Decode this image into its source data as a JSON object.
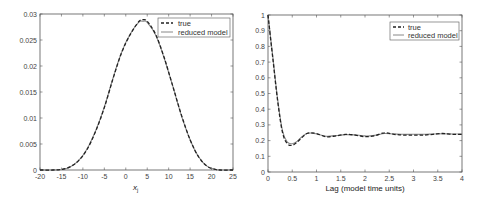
{
  "chart_data": [
    {
      "type": "line",
      "title": "",
      "xlabel": "x_j",
      "ylabel": "",
      "xlim": [
        -20,
        25
      ],
      "ylim": [
        0,
        0.03
      ],
      "xticks": [
        "-20",
        "-15",
        "-10",
        "-5",
        "0",
        "5",
        "10",
        "15",
        "20",
        "25"
      ],
      "yticks": [
        "0",
        "0.005",
        "0.01",
        "0.015",
        "0.02",
        "0.025",
        "0.03"
      ],
      "grid": false,
      "legend_position": "upper right",
      "legend": [
        "true",
        "reduced model"
      ],
      "series": [
        {
          "name": "true",
          "style": "dashed",
          "x": [
            -20,
            -17,
            -15,
            -13,
            -11,
            -9,
            -7,
            -5,
            -3,
            -1,
            1,
            3,
            4,
            5,
            7,
            9,
            11,
            13,
            15,
            17,
            19,
            21,
            22,
            25
          ],
          "y": [
            0,
            0,
            0.0001,
            0.0006,
            0.0018,
            0.004,
            0.0075,
            0.012,
            0.0175,
            0.0225,
            0.026,
            0.0285,
            0.0289,
            0.0286,
            0.026,
            0.0215,
            0.016,
            0.0105,
            0.0058,
            0.0025,
            0.0007,
            0.0001,
            0,
            0
          ]
        },
        {
          "name": "reduced model",
          "style": "solid",
          "x": [
            -20,
            -17,
            -15,
            -13,
            -11,
            -9,
            -7,
            -5,
            -3,
            -1,
            1,
            3,
            4,
            5,
            7,
            9,
            11,
            13,
            15,
            17,
            19,
            21,
            22,
            25
          ],
          "y": [
            0,
            0,
            0.0001,
            0.0006,
            0.0018,
            0.0041,
            0.0076,
            0.0121,
            0.0176,
            0.0226,
            0.0261,
            0.0284,
            0.0286,
            0.0284,
            0.0259,
            0.0214,
            0.016,
            0.0104,
            0.0058,
            0.0025,
            0.0007,
            0.0001,
            0,
            0
          ]
        }
      ]
    },
    {
      "type": "line",
      "title": "",
      "xlabel": "Lag (model time units)",
      "ylabel": "",
      "xlim": [
        0,
        4
      ],
      "ylim": [
        0,
        1
      ],
      "xticks": [
        "0",
        "0.5",
        "1",
        "1.5",
        "2",
        "2.5",
        "3",
        "3.5",
        "4"
      ],
      "yticks": [
        "0",
        "0.1",
        "0.2",
        "0.3",
        "0.4",
        "0.5",
        "0.6",
        "0.7",
        "0.8",
        "0.9",
        "1"
      ],
      "grid": false,
      "legend_position": "upper right",
      "legend": [
        "true",
        "reduced model"
      ],
      "series": [
        {
          "name": "true",
          "style": "dashed",
          "x": [
            0,
            0.1,
            0.2,
            0.3,
            0.4,
            0.5,
            0.6,
            0.7,
            0.8,
            0.9,
            1.0,
            1.2,
            1.4,
            1.6,
            1.8,
            2.0,
            2.2,
            2.4,
            2.6,
            2.8,
            3.0,
            3.2,
            3.4,
            3.6,
            3.8,
            4.0
          ],
          "y": [
            1.0,
            0.72,
            0.45,
            0.25,
            0.18,
            0.17,
            0.19,
            0.22,
            0.245,
            0.25,
            0.245,
            0.225,
            0.23,
            0.24,
            0.235,
            0.225,
            0.23,
            0.25,
            0.24,
            0.235,
            0.235,
            0.235,
            0.24,
            0.245,
            0.24,
            0.24
          ]
        },
        {
          "name": "reduced model",
          "style": "solid",
          "x": [
            0,
            0.1,
            0.2,
            0.3,
            0.4,
            0.5,
            0.6,
            0.7,
            0.8,
            0.9,
            1.0,
            1.2,
            1.4,
            1.6,
            1.8,
            2.0,
            2.2,
            2.4,
            2.6,
            2.8,
            3.0,
            3.2,
            3.4,
            3.6,
            3.8,
            4.0
          ],
          "y": [
            1.0,
            0.73,
            0.46,
            0.26,
            0.19,
            0.18,
            0.195,
            0.225,
            0.245,
            0.248,
            0.243,
            0.228,
            0.232,
            0.238,
            0.236,
            0.23,
            0.233,
            0.245,
            0.242,
            0.24,
            0.24,
            0.24,
            0.242,
            0.243,
            0.242,
            0.242
          ]
        }
      ]
    }
  ],
  "left": {
    "xlabel_main": "x",
    "xlabel_sub": "j",
    "legend_true": "true",
    "legend_model": "reduced model"
  },
  "right": {
    "xlabel": "Lag (model time units)",
    "legend_true": "true",
    "legend_model": "reduced model"
  }
}
